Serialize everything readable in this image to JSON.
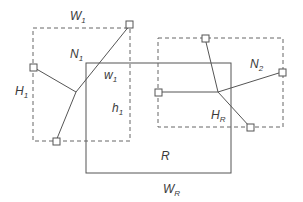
{
  "diagram": {
    "title": "",
    "colors": {
      "stroke": "#555555",
      "dashed": "#666666",
      "text": "#3a3a3a",
      "background": "#ffffff"
    },
    "labels": {
      "W1": {
        "main": "W",
        "sub": "1"
      },
      "N1": {
        "main": "N",
        "sub": "1"
      },
      "w1": {
        "main": "w",
        "sub": "1"
      },
      "H1": {
        "main": "H",
        "sub": "1"
      },
      "h1": {
        "main": "h",
        "sub": "1"
      },
      "N2": {
        "main": "N",
        "sub": "2"
      },
      "HR": {
        "main": "H",
        "sub": "R"
      },
      "R": {
        "main": "R"
      },
      "WR": {
        "main": "W",
        "sub": "R"
      }
    },
    "nets": [
      {
        "name": "N1",
        "bbox": [
          33,
          28,
          130,
          141
        ],
        "steiner_point": [
          76,
          92
        ],
        "pins": [
          [
            130,
            25
          ],
          [
            33,
            67
          ],
          [
            56,
            141
          ]
        ]
      },
      {
        "name": "N2",
        "bbox": [
          158,
          38,
          283,
          127
        ],
        "steiner_point": [
          218,
          92
        ],
        "pins": [
          [
            205,
            38
          ],
          [
            158,
            92
          ],
          [
            282,
            72
          ],
          [
            250,
            127
          ]
        ]
      }
    ],
    "region": {
      "name": "R",
      "bbox": [
        86,
        63,
        231,
        173
      ]
    }
  }
}
